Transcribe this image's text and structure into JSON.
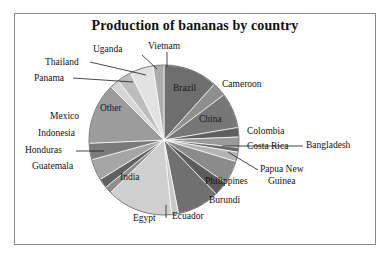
{
  "chart": {
    "title": "Production of bananas by country"
  },
  "chart_data": {
    "type": "pie",
    "title": "Production of bananas by country",
    "xlabel": "",
    "ylabel": "",
    "legend_position": "none",
    "labels_position": "outside-and-inside",
    "categories": [
      "Brazil",
      "Cameroon",
      "China",
      "Colombia",
      "Costa Rica",
      "Bangladesh",
      "Papua New Guinea",
      "Philippines",
      "Burundi",
      "Ecuador",
      "Egypt",
      "India",
      "Guatemala",
      "Honduras",
      "Indonesia",
      "Mexico",
      "Other",
      "Panama",
      "Thailand",
      "Uganda",
      "Vietnam"
    ],
    "values": [
      11.5,
      3.0,
      7.5,
      2.0,
      2.2,
      1.0,
      2.0,
      5.0,
      3.0,
      9.0,
      1.5,
      14.0,
      1.5,
      2.0,
      4.5,
      3.5,
      13.0,
      2.0,
      3.0,
      5.0,
      2.3
    ],
    "units": "percent of world production",
    "slice_colors": [
      "#6e6e6e",
      "#8f8f8f",
      "#777777",
      "#5f5f5f",
      "#9a9a9a",
      "#6a6a6a",
      "#b4b4b4",
      "#8b8b8b",
      "#5c5c5c",
      "#707070",
      "#c8c8c8",
      "#cfcfcf",
      "#8d8d8d",
      "#606060",
      "#a5a5a5",
      "#7b7b7b",
      "#9c9c9c",
      "#d6d6d6",
      "#bdbdbd",
      "#e2e2e2",
      "#acacac"
    ]
  },
  "labels": {
    "brazil": "Brazil",
    "cameroon": "Cameroon",
    "china": "China",
    "colombia": "Colombia",
    "costa_rica": "Costa Rica",
    "bangladesh": "Bangladesh",
    "papua_new_guinea_line1": "Papua New",
    "papua_new_guinea_line2": "Guinea",
    "philippines": "Philippines",
    "burundi": "Burundi",
    "ecuador": "Ecuador",
    "egypt": "Egypt",
    "india": "India",
    "guatemala": "Guatemala",
    "honduras": "Honduras",
    "indonesia": "Indonesia",
    "mexico": "Mexico",
    "other": "Other",
    "panama": "Panama",
    "thailand": "Thailand",
    "uganda": "Uganda",
    "vietnam": "Vietnam"
  }
}
